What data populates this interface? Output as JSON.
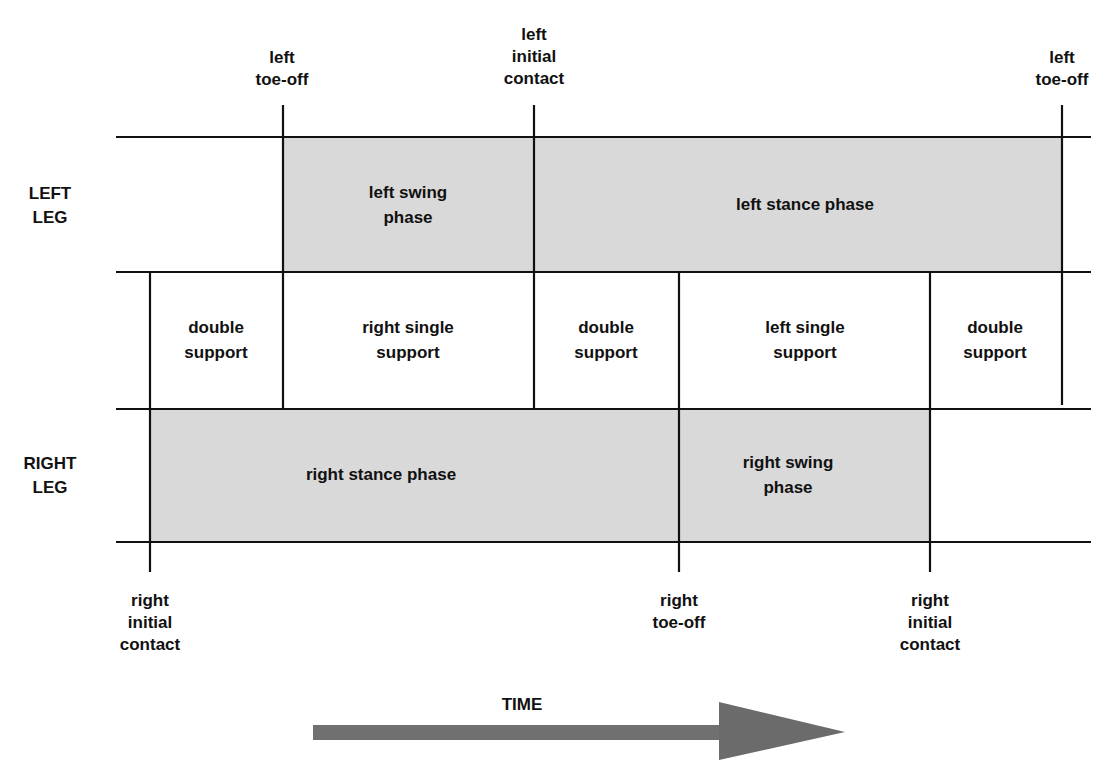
{
  "diagram": {
    "colors": {
      "line": "#111111",
      "phase_fill": "#d9d9d9",
      "arrow": "#707070",
      "background": "#ffffff"
    },
    "rows": {
      "left_leg": {
        "line1": "LEFT",
        "line2": "LEG"
      },
      "right_leg": {
        "line1": "RIGHT",
        "line2": "LEG"
      }
    },
    "top_events": [
      {
        "id": "left-toe-off-1",
        "line1": "left",
        "line2": "toe-off",
        "line3": ""
      },
      {
        "id": "left-initial-contact",
        "line1": "left",
        "line2": "initial",
        "line3": "contact"
      },
      {
        "id": "left-toe-off-2",
        "line1": "left",
        "line2": "toe-off",
        "line3": ""
      }
    ],
    "bottom_events": [
      {
        "id": "right-initial-contact-1",
        "line1": "right",
        "line2": "initial",
        "line3": "contact"
      },
      {
        "id": "right-toe-off",
        "line1": "right",
        "line2": "toe-off",
        "line3": ""
      },
      {
        "id": "right-initial-contact-2",
        "line1": "right",
        "line2": "initial",
        "line3": "contact"
      }
    ],
    "left_leg_phases": [
      {
        "id": "left-swing-phase",
        "line1": "left swing",
        "line2": "phase"
      },
      {
        "id": "left-stance-phase",
        "line1": "left stance phase",
        "line2": ""
      }
    ],
    "support_phases": [
      {
        "id": "double-support-1",
        "line1": "double",
        "line2": "support"
      },
      {
        "id": "right-single-support",
        "line1": "right single",
        "line2": "support"
      },
      {
        "id": "double-support-2",
        "line1": "double",
        "line2": "support"
      },
      {
        "id": "left-single-support",
        "line1": "left single",
        "line2": "support"
      },
      {
        "id": "double-support-3",
        "line1": "double",
        "line2": "support"
      }
    ],
    "right_leg_phases": [
      {
        "id": "right-stance-phase",
        "line1": "right stance phase",
        "line2": ""
      },
      {
        "id": "right-swing-phase",
        "line1": "right swing",
        "line2": "phase"
      }
    ],
    "time_axis": {
      "label": "TIME",
      "direction": "right-arrow"
    }
  }
}
